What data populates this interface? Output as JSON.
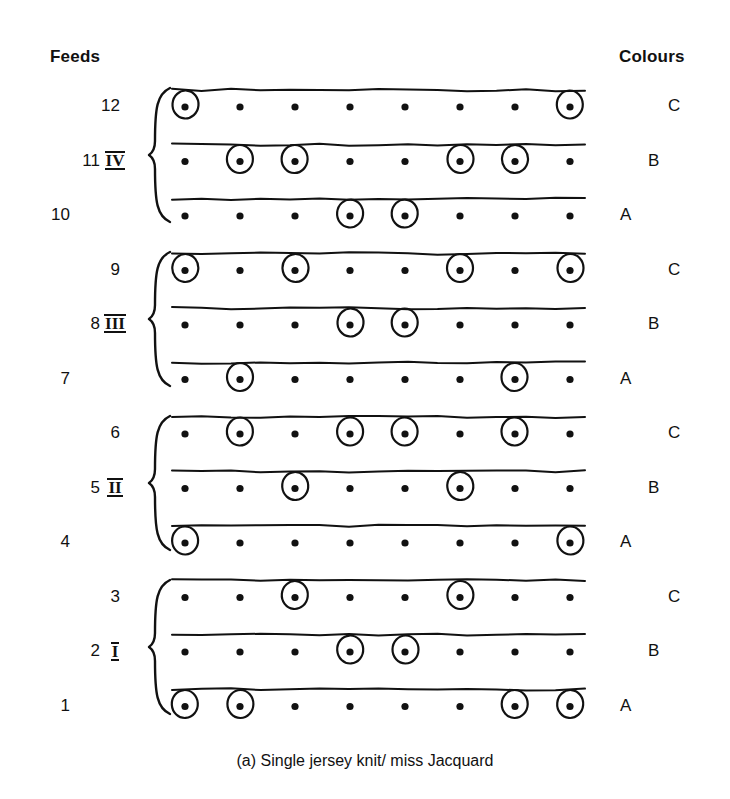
{
  "headers": {
    "feeds": "Feeds",
    "colours": "Colours"
  },
  "caption": "(a) Single jersey knit/ miss Jacquard",
  "colors": {
    "ink": "#111111",
    "background": "#ffffff"
  },
  "geometry": {
    "column_count": 8,
    "first_column_x": 185,
    "column_spacing": 55,
    "first_row_y": 107,
    "row_spacing": 54.5,
    "dot_radius": 3.6,
    "circle_rx": 13,
    "circle_ry": 14,
    "line_offset": -17,
    "line_x_start": 172,
    "line_x_end": 585
  },
  "groups": [
    {
      "numeral": "IV",
      "feeds": [
        12,
        11,
        10
      ],
      "label_y": 162,
      "brace_top": 88,
      "brace_bottom": 222
    },
    {
      "numeral": "III",
      "feeds": [
        9,
        8,
        7
      ],
      "label_y": 325,
      "brace_top": 252,
      "brace_bottom": 386
    },
    {
      "numeral": "II",
      "feeds": [
        6,
        5,
        4
      ],
      "label_y": 489,
      "brace_top": 416,
      "brace_bottom": 550
    },
    {
      "numeral": "I",
      "feeds": [
        3,
        2,
        1
      ],
      "label_y": 653,
      "brace_top": 580,
      "brace_bottom": 714
    }
  ],
  "rows": [
    {
      "feed": "12",
      "colour": "C",
      "position_in_group": "top",
      "circles": [
        1,
        8
      ]
    },
    {
      "feed": "11",
      "colour": "B",
      "position_in_group": "middle",
      "circles": [
        2,
        3,
        6,
        7
      ]
    },
    {
      "feed": "10",
      "colour": "A",
      "position_in_group": "bottom",
      "circles": [
        4,
        5
      ]
    },
    {
      "feed": "9",
      "colour": "C",
      "position_in_group": "top",
      "circles": [
        1,
        3,
        6,
        8
      ]
    },
    {
      "feed": "8",
      "colour": "B",
      "position_in_group": "middle",
      "circles": [
        4,
        5
      ]
    },
    {
      "feed": "7",
      "colour": "A",
      "position_in_group": "bottom",
      "circles": [
        2,
        7
      ]
    },
    {
      "feed": "6",
      "colour": "C",
      "position_in_group": "top",
      "circles": [
        2,
        4,
        5,
        7
      ]
    },
    {
      "feed": "5",
      "colour": "B",
      "position_in_group": "middle",
      "circles": [
        3,
        6
      ]
    },
    {
      "feed": "4",
      "colour": "A",
      "position_in_group": "bottom",
      "circles": [
        1,
        8
      ]
    },
    {
      "feed": "3",
      "colour": "C",
      "position_in_group": "top",
      "circles": [
        3,
        6
      ]
    },
    {
      "feed": "2",
      "colour": "B",
      "position_in_group": "middle",
      "circles": [
        4,
        5
      ]
    },
    {
      "feed": "1",
      "colour": "A",
      "position_in_group": "bottom",
      "circles": [
        1,
        2,
        7,
        8
      ]
    }
  ],
  "stagger": {
    "feed_label_x": {
      "top": 86,
      "middle": 66,
      "bottom": 36
    },
    "colour_label_x": {
      "top": 668,
      "middle": 648,
      "bottom": 620
    }
  },
  "chart_data": {
    "type": "table",
    "title": "(a) Single jersey knit/ miss Jacquard",
    "xlabel": "Needle position (1-8)",
    "ylabel": "Feed",
    "legend": [
      "filled dot = miss",
      "circled dot = knit"
    ],
    "categories": [
      "1",
      "2",
      "3",
      "4",
      "5",
      "6",
      "7",
      "8"
    ],
    "series": [
      {
        "name": "Feed 12 (C)",
        "values": [
          1,
          0,
          0,
          0,
          0,
          0,
          0,
          1
        ]
      },
      {
        "name": "Feed 11 (B)",
        "values": [
          0,
          1,
          1,
          0,
          0,
          1,
          1,
          0
        ]
      },
      {
        "name": "Feed 10 (A)",
        "values": [
          0,
          0,
          0,
          1,
          1,
          0,
          0,
          0
        ]
      },
      {
        "name": "Feed 9 (C)",
        "values": [
          1,
          0,
          1,
          0,
          0,
          1,
          0,
          1
        ]
      },
      {
        "name": "Feed 8 (B)",
        "values": [
          0,
          0,
          0,
          1,
          1,
          0,
          0,
          0
        ]
      },
      {
        "name": "Feed 7 (A)",
        "values": [
          0,
          1,
          0,
          0,
          0,
          0,
          1,
          0
        ]
      },
      {
        "name": "Feed 6 (C)",
        "values": [
          0,
          1,
          0,
          1,
          1,
          0,
          1,
          0
        ]
      },
      {
        "name": "Feed 5 (B)",
        "values": [
          0,
          0,
          1,
          0,
          0,
          1,
          0,
          0
        ]
      },
      {
        "name": "Feed 4 (A)",
        "values": [
          1,
          0,
          0,
          0,
          0,
          0,
          0,
          1
        ]
      },
      {
        "name": "Feed 3 (C)",
        "values": [
          0,
          0,
          1,
          0,
          0,
          1,
          0,
          0
        ]
      },
      {
        "name": "Feed 2 (B)",
        "values": [
          0,
          0,
          0,
          1,
          1,
          0,
          0,
          0
        ]
      },
      {
        "name": "Feed 1 (A)",
        "values": [
          1,
          1,
          0,
          0,
          0,
          0,
          1,
          1
        ]
      }
    ]
  }
}
